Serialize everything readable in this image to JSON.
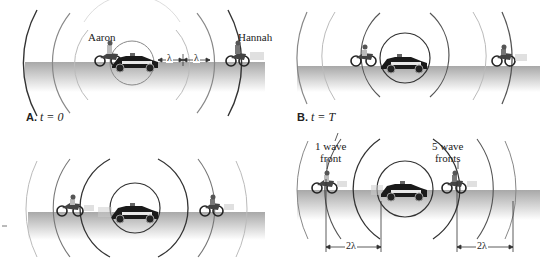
{
  "figure": {
    "panels": [
      {
        "id": "A",
        "letter": "A.",
        "caption": "t = 0",
        "names": {
          "left_rider": "Aaron",
          "right_rider": "Hannah"
        },
        "annotations": {
          "lambda1": "λ",
          "lambda2": "λ"
        }
      },
      {
        "id": "B",
        "letter": "B.",
        "caption": "t = T"
      },
      {
        "id": "C",
        "letter": "",
        "caption": ""
      },
      {
        "id": "D",
        "letter": "",
        "caption": "",
        "annotations": {
          "left_label": "1 wave front",
          "left_label_line1": "1 wave",
          "left_label_line2": "front",
          "right_label_line1": "5 wave",
          "right_label_line2": "fronts",
          "left_dimension": "2λ",
          "right_dimension": "2λ"
        }
      }
    ],
    "colors": {
      "wave_dark": "#333333",
      "wave_mid": "#777777",
      "wave_light": "#bbbbbb",
      "road_top": "#a8a8a8",
      "road_bottom": "#ffffff",
      "car_body": "#1a1a1a",
      "car_stripe": "#e8e8e8"
    }
  }
}
